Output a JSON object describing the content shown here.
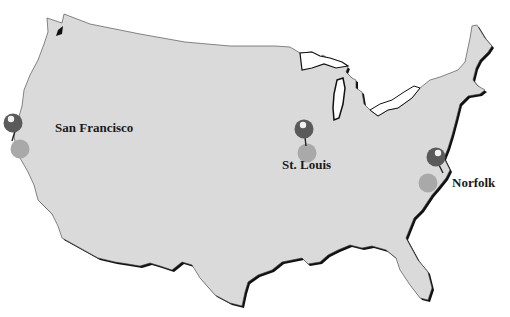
{
  "map": {
    "title_partial": "",
    "region": "Contiguous United States",
    "colors": {
      "land_fill": "#dadada",
      "coast_shadow": "#111111",
      "background": "#ffffff",
      "pin_head_dark": "#5a5a5a",
      "pin_head_highlight": "#f2f2f2",
      "pin_shadow_light": "#a9a9a9",
      "label_text": "#1a1a1a"
    },
    "locations": [
      {
        "id": "san-francisco",
        "label": "San Francisco",
        "pin": {
          "x": 13,
          "y": 123
        },
        "shadow": {
          "x": 20,
          "y": 149
        },
        "label_pos": {
          "x": 55,
          "y": 128
        }
      },
      {
        "id": "st-louis",
        "label": "St. Louis",
        "pin": {
          "x": 304,
          "y": 129
        },
        "shadow": {
          "x": 307,
          "y": 153
        },
        "label_pos": {
          "x": 282,
          "y": 164
        }
      },
      {
        "id": "norfolk",
        "label": "Norfolk",
        "pin": {
          "x": 436,
          "y": 157
        },
        "shadow": {
          "x": 428,
          "y": 183
        },
        "label_pos": {
          "x": 452,
          "y": 176
        }
      }
    ]
  }
}
